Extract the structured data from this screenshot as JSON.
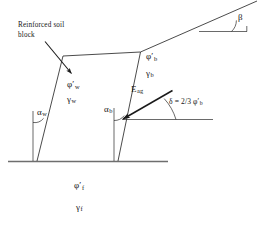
{
  "figure": {
    "kind": "engineering-diagram",
    "stroke_color": "#1a1a1a",
    "ground_color": "#6e6e6e",
    "text_color": "#151515",
    "background_color": "#ffffff"
  },
  "annotations": {
    "callout": {
      "line1": "Reinforced soil",
      "line2": "block"
    },
    "wall_angle": {
      "symbol": "α",
      "subscript": "w"
    },
    "wall_friction": {
      "symbol": "φ",
      "prime": "′",
      "subscript": "w"
    },
    "wall_unit_weight": {
      "symbol": "γ",
      "subscript": "w"
    },
    "block_angle": {
      "symbol": "α",
      "subscript": "b"
    },
    "block_friction": {
      "symbol": "φ",
      "prime": "′",
      "subscript": "b"
    },
    "block_unit_weight": {
      "symbol": "γ",
      "subscript": "b"
    },
    "earth_force": {
      "symbol": "E",
      "subscript": "ag"
    },
    "delta_equation": {
      "text": "δ = 2/3 φ",
      "prime": "′",
      "subscript": "b"
    },
    "slope_angle": {
      "symbol": "β"
    },
    "foundation_friction": {
      "symbol": "φ",
      "prime": "′",
      "subscript": "f"
    },
    "foundation_unit_weight": {
      "symbol": "γ",
      "subscript": "f"
    }
  }
}
